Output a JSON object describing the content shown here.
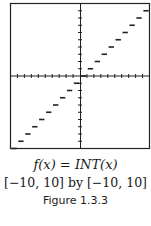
{
  "caption": {
    "function": "f(x) = INT(x)",
    "window": "[−10, 10] by [−10, 10]",
    "figure_label": "Figure 1.3.3"
  },
  "chart_data": {
    "type": "line",
    "title": "f(x) = INT(x)",
    "subtitle": "[-10, 10] by [-10, 10]",
    "xlabel": "",
    "ylabel": "",
    "xlim": [
      -10,
      10
    ],
    "ylim": [
      -10,
      10
    ],
    "xticks_step": 1,
    "yticks_step": 1,
    "grid": false,
    "legend": null,
    "style": "step (greatest integer function), horizontal segments of length 1",
    "series": [
      {
        "name": "INT(x)",
        "segments": [
          {
            "x": [
              -10,
              -9
            ],
            "y": -10
          },
          {
            "x": [
              -9,
              -8
            ],
            "y": -9
          },
          {
            "x": [
              -8,
              -7
            ],
            "y": -8
          },
          {
            "x": [
              -7,
              -6
            ],
            "y": -7
          },
          {
            "x": [
              -6,
              -5
            ],
            "y": -6
          },
          {
            "x": [
              -5,
              -4
            ],
            "y": -5
          },
          {
            "x": [
              -4,
              -3
            ],
            "y": -4
          },
          {
            "x": [
              -3,
              -2
            ],
            "y": -3
          },
          {
            "x": [
              -2,
              -1
            ],
            "y": -2
          },
          {
            "x": [
              -1,
              0
            ],
            "y": -1
          },
          {
            "x": [
              0,
              1
            ],
            "y": 0
          },
          {
            "x": [
              1,
              2
            ],
            "y": 1
          },
          {
            "x": [
              2,
              3
            ],
            "y": 2
          },
          {
            "x": [
              3,
              4
            ],
            "y": 3
          },
          {
            "x": [
              4,
              5
            ],
            "y": 4
          },
          {
            "x": [
              5,
              6
            ],
            "y": 5
          },
          {
            "x": [
              6,
              7
            ],
            "y": 6
          },
          {
            "x": [
              7,
              8
            ],
            "y": 7
          },
          {
            "x": [
              8,
              9
            ],
            "y": 8
          },
          {
            "x": [
              9,
              10
            ],
            "y": 9
          }
        ]
      }
    ],
    "annotations": [
      "Figure 1.3.3"
    ]
  },
  "colors": {
    "ink": "#1a1a1a",
    "background": "#ffffff"
  }
}
